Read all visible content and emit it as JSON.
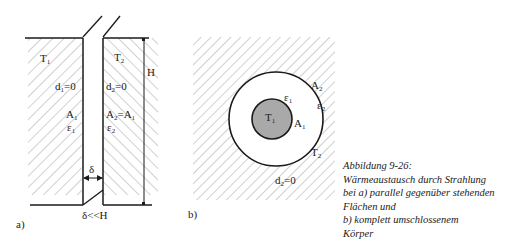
{
  "diagram_a": {
    "label": "a)",
    "left_plate": {
      "temperature": "T",
      "temperature_sub": "1",
      "thickness": "d",
      "thickness_sub": "1",
      "thickness_val": "=0",
      "area": "A",
      "area_sub": "1",
      "emissivity": "ε",
      "emissivity_sub": "1"
    },
    "right_plate": {
      "temperature": "T",
      "temperature_sub": "2",
      "thickness": "d",
      "thickness_sub": "2",
      "thickness_val": "=0",
      "area": "A",
      "area_sub": "2",
      "area_eq": "=A",
      "area_eq_sub": "1",
      "emissivity": "ε",
      "emissivity_sub": "2"
    },
    "height_label": "H",
    "gap_label": "δ",
    "condition": "δ<<H"
  },
  "diagram_b": {
    "label": "b)",
    "inner_body": {
      "temperature": "T",
      "temperature_sub": "1",
      "area": "A",
      "area_sub": "1",
      "emissivity": "ε",
      "emissivity_sub": "1"
    },
    "enclosure": {
      "temperature": "T",
      "temperature_sub": "2",
      "area": "A",
      "area_sub": "2",
      "emissivity": "ε",
      "emissivity_sub": "2",
      "thickness": "d",
      "thickness_sub": "2",
      "thickness_val": "=0"
    }
  },
  "caption": {
    "lines": [
      "Abbildung 9-26:",
      "Wärmeaustausch durch Strahlung",
      "bei a) parallel gegenüber stehenden",
      "Flächen und",
      "b) komplett umschlossenem",
      "Körper"
    ]
  },
  "colors": {
    "line": "#1a1a1a",
    "hatch": "#8a8a8a",
    "inner_fill": "#a9a9a9"
  }
}
